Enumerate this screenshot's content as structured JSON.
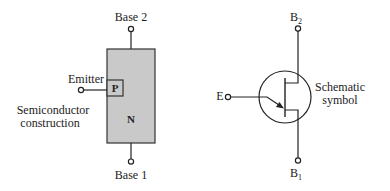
{
  "left": {
    "base2_label": "Base 2",
    "base1_label": "Base 1",
    "emitter_label": "Emitter",
    "p_region": "P",
    "n_region": "N",
    "caption_line1": "Semiconductor",
    "caption_line2": "construction",
    "fill_color": "#c9c9c9"
  },
  "right": {
    "b2_label": "B",
    "b2_sub": "2",
    "b1_label": "B",
    "b1_sub": "1",
    "e_label": "E",
    "caption_line1": "Schematic",
    "caption_line2": "symbol"
  }
}
